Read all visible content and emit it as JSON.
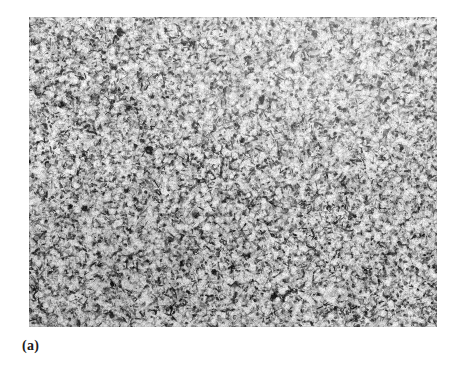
{
  "figure": {
    "panel_label": "(a)",
    "background_color": "#ffffff",
    "image": {
      "name": "metallographic-micrograph",
      "description": "Optical micrograph of an etched metal specimen showing a fine, dense, randomly oriented acicular/lath microstructure of dark etched features on a light gray matrix",
      "x": 29,
      "y": 17,
      "width": 408,
      "height": 310,
      "matrix_color": "#d8d8d8",
      "feature_color": "#1a1a1a",
      "mid_tone_color": "#8a8a8a",
      "highlight_color": "#f2f2f2"
    }
  }
}
